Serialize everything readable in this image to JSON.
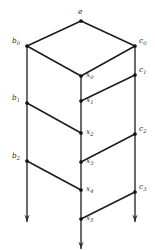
{
  "figure": {
    "kind": "directed-graph-diagram",
    "width": 155,
    "height": 250,
    "background_color": "#ffffff",
    "line_color": "#1a1a1a",
    "ray_color": "#3a3a3a",
    "vertex_color": "#111111"
  },
  "nodes": [
    {
      "id": "e",
      "label": "e",
      "sub": "",
      "x": 81,
      "y": 21,
      "label_x": 78,
      "label_y": 8,
      "dot": true
    },
    {
      "id": "b0",
      "label": "b",
      "sub": "0",
      "x": 27,
      "y": 46,
      "label_x": 12,
      "label_y": 37,
      "dot": true
    },
    {
      "id": "b1",
      "label": "b",
      "sub": "1",
      "x": 27,
      "y": 103,
      "label_x": 12,
      "label_y": 94,
      "dot": true
    },
    {
      "id": "b2",
      "label": "b",
      "sub": "2",
      "x": 27,
      "y": 161,
      "label_x": 12,
      "label_y": 152,
      "dot": true
    },
    {
      "id": "c0",
      "label": "c",
      "sub": "0",
      "x": 135,
      "y": 46,
      "label_x": 139,
      "label_y": 37,
      "dot": true
    },
    {
      "id": "c1",
      "label": "c",
      "sub": "1",
      "x": 135,
      "y": 75,
      "label_x": 139,
      "label_y": 66,
      "dot": true
    },
    {
      "id": "c2",
      "label": "c",
      "sub": "2",
      "x": 135,
      "y": 134,
      "label_x": 139,
      "label_y": 125,
      "dot": true
    },
    {
      "id": "c3",
      "label": "c",
      "sub": "3",
      "x": 135,
      "y": 192,
      "label_x": 139,
      "label_y": 183,
      "dot": true
    },
    {
      "id": "x0",
      "label": "x",
      "sub": "0",
      "x": 81,
      "y": 76,
      "label_x": 86,
      "label_y": 71,
      "dot": true
    },
    {
      "id": "x1",
      "label": "x",
      "sub": "1",
      "x": 81,
      "y": 101,
      "label_x": 86,
      "label_y": 96,
      "dot": true
    },
    {
      "id": "x2",
      "label": "x",
      "sub": "2",
      "x": 81,
      "y": 133,
      "label_x": 86,
      "label_y": 128,
      "dot": true
    },
    {
      "id": "x3",
      "label": "x",
      "sub": "3",
      "x": 81,
      "y": 162,
      "label_x": 86,
      "label_y": 157,
      "dot": true
    },
    {
      "id": "x4",
      "label": "x",
      "sub": "4",
      "x": 81,
      "y": 190,
      "label_x": 86,
      "label_y": 185,
      "dot": true
    },
    {
      "id": "x5",
      "label": "x",
      "sub": "5",
      "x": 81,
      "y": 219,
      "label_x": 86,
      "label_y": 214,
      "dot": true
    }
  ],
  "edges": [
    {
      "id": "e-b0",
      "from": "e",
      "to": "b0",
      "x1": 81,
      "y1": 21,
      "x2": 27,
      "y2": 46
    },
    {
      "id": "e-c0",
      "from": "e",
      "to": "c0",
      "x1": 81,
      "y1": 21,
      "x2": 135,
      "y2": 46
    },
    {
      "id": "b0-x0",
      "from": "b0",
      "to": "x0",
      "x1": 27,
      "y1": 46,
      "x2": 81,
      "y2": 76
    },
    {
      "id": "x0-c0",
      "from": "x0",
      "to": "c0",
      "x1": 81,
      "y1": 76,
      "x2": 135,
      "y2": 46
    },
    {
      "id": "x1-c1",
      "from": "x1",
      "to": "c1",
      "x1": 81,
      "y1": 101,
      "x2": 135,
      "y2": 75
    },
    {
      "id": "b1-x2",
      "from": "b1",
      "to": "x2",
      "x1": 27,
      "y1": 103,
      "x2": 81,
      "y2": 133
    },
    {
      "id": "x3-c2",
      "from": "x3",
      "to": "c2",
      "x1": 81,
      "y1": 162,
      "x2": 135,
      "y2": 134
    },
    {
      "id": "b2-x4",
      "from": "b2",
      "to": "x4",
      "x1": 27,
      "y1": 161,
      "x2": 81,
      "y2": 190
    },
    {
      "id": "x5-c3",
      "from": "x5",
      "to": "c3",
      "x1": 81,
      "y1": 219,
      "x2": 135,
      "y2": 192
    }
  ],
  "rays": [
    {
      "id": "ray-b",
      "label": "left-b-ray",
      "x": 27,
      "y_start": 46,
      "y_end": 222
    },
    {
      "id": "ray-x",
      "label": "middle-x-ray",
      "x": 81,
      "y_start": 76,
      "y_end": 249
    },
    {
      "id": "ray-c",
      "label": "right-c-ray",
      "x": 135,
      "y_start": 46,
      "y_end": 222
    }
  ],
  "arrowheads": [
    {
      "id": "arrow-b",
      "x": 27,
      "y": 222
    },
    {
      "id": "arrow-x",
      "x": 81,
      "y": 249
    },
    {
      "id": "arrow-c",
      "x": 135,
      "y": 222
    }
  ]
}
